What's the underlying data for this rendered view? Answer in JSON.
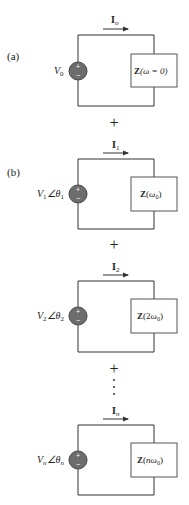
{
  "diagram": {
    "part_labels": {
      "a": "(a)",
      "b": "(b)"
    },
    "operator": "+",
    "ellipsis": "⋮",
    "colors": {
      "wire": "#333333",
      "source_fill": "#6d6d6d",
      "source_stroke": "#444444",
      "box_stroke": "#555555",
      "text": "#222222"
    },
    "circuits": [
      {
        "id": "a",
        "current": {
          "symbol": "I",
          "subscript": "o"
        },
        "source": {
          "magnitude": "V",
          "mag_sub": "0",
          "angle": "",
          "angle_sub": "",
          "polarity_plus": "+",
          "polarity_minus": "−"
        },
        "impedance": {
          "symbol": "Z",
          "arg": "(ω = 0)"
        }
      },
      {
        "id": "b1",
        "current": {
          "symbol": "I",
          "subscript": "1"
        },
        "source": {
          "magnitude": "V",
          "mag_sub": "1",
          "angle": "∠θ",
          "angle_sub": "1",
          "polarity_plus": "+",
          "polarity_minus": "−"
        },
        "impedance": {
          "symbol": "Z",
          "arg_pre": "(",
          "arg_coef": "",
          "arg_omega": "ω",
          "arg_sub": "0",
          "arg_post": ")"
        }
      },
      {
        "id": "b2",
        "current": {
          "symbol": "I",
          "subscript": "2"
        },
        "source": {
          "magnitude": "V",
          "mag_sub": "2",
          "angle": "∠θ",
          "angle_sub": "2",
          "polarity_plus": "+",
          "polarity_minus": "−"
        },
        "impedance": {
          "symbol": "Z",
          "arg_pre": "(",
          "arg_coef": "2",
          "arg_omega": "ω",
          "arg_sub": "0",
          "arg_post": ")"
        }
      },
      {
        "id": "bn",
        "current": {
          "symbol": "I",
          "subscript": "n"
        },
        "source": {
          "magnitude": "V",
          "mag_sub": "n",
          "angle": "∠θ",
          "angle_sub": "n",
          "polarity_plus": "+",
          "polarity_minus": "−"
        },
        "impedance": {
          "symbol": "Z",
          "arg_pre": "(",
          "arg_coef": "n",
          "arg_omega": "ω",
          "arg_sub": "0",
          "arg_post": ")"
        }
      }
    ]
  }
}
